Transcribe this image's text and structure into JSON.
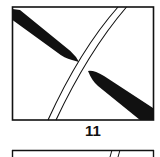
{
  "figure": {
    "panel_label": "11",
    "colors": {
      "ink": "#111111",
      "background": "#ffffff"
    },
    "elements": [
      "frame-box",
      "thick-band-upper-left",
      "thick-band-lower-right",
      "double-curved-line",
      "next-panel-frame-top"
    ]
  }
}
